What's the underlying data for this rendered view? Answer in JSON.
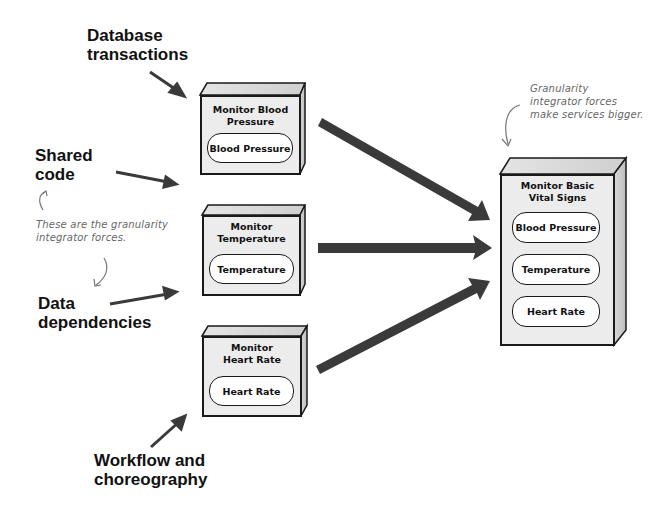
{
  "forces": {
    "title": "Granularity integrator forces",
    "items": [
      {
        "id": "database-transactions",
        "label": "Database\ntransactions"
      },
      {
        "id": "shared-code",
        "label": "Shared\ncode"
      },
      {
        "id": "data-dependencies",
        "label": "Data\ndependencies"
      },
      {
        "id": "workflow-choreography",
        "label": "Workflow and\nchoreography"
      }
    ]
  },
  "annotations": {
    "left_note": "These are the granularity\nintegrator forces.",
    "right_note": "Granularity\nintegrator forces\nmake services bigger."
  },
  "services": [
    {
      "id": "monitor-blood-pressure",
      "title": "Monitor Blood\nPressure",
      "components": [
        "Blood Pressure"
      ]
    },
    {
      "id": "monitor-temperature",
      "title": "Monitor\nTemperature",
      "components": [
        "Temperature"
      ]
    },
    {
      "id": "monitor-heart-rate",
      "title": "Monitor\nHeart Rate",
      "components": [
        "Heart Rate"
      ]
    }
  ],
  "combined_service": {
    "id": "monitor-basic-vital-signs",
    "title": "Monitor Basic\nVital Signs",
    "components": [
      "Blood Pressure",
      "Temperature",
      "Heart Rate"
    ]
  },
  "colors": {
    "arrow": "#3a3a3a",
    "box_face": "#ececec",
    "box_side": "#c8c8c8",
    "note_text": "#666666",
    "outline": "#1a1a1a"
  }
}
